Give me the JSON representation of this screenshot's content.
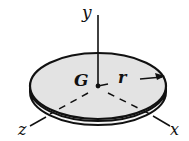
{
  "figure": {
    "labels": {
      "y_axis": "y",
      "x_axis": "x",
      "z_axis": "z",
      "centroid": "G",
      "radius": "r"
    },
    "colors": {
      "disk_fill": "#e3e3e3",
      "ink": "#111111",
      "background": "#ffffff"
    }
  }
}
